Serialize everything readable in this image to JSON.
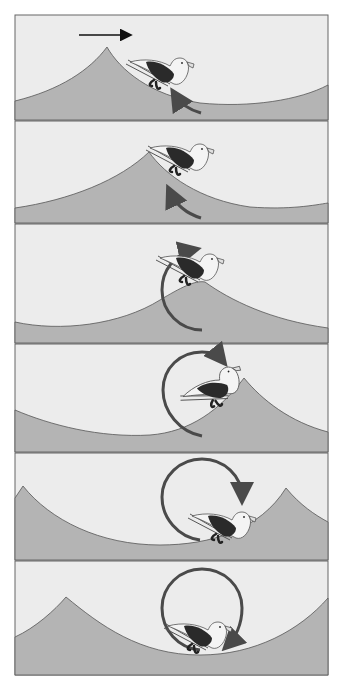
{
  "figure": {
    "type": "multi-panel sequence diagram",
    "panel_count": 6,
    "colors": {
      "sky": "#ececec",
      "water": "#b4b4b4",
      "outline": "#555555",
      "orbit_arrow": "#4a4a4a",
      "bird_wing": "#2a2a2a",
      "bird_body": "#f4f4f4"
    },
    "direction_arrow": "wave travels right (arrow in panel 1)",
    "panels": [
      {
        "index": 1,
        "description": "bird on back slope of wave just behind crest; short curved arrow below bird",
        "orbit": "short arc"
      },
      {
        "index": 2,
        "description": "bird slides down forward face as crest passes; curved arrow below",
        "orbit": "short arc"
      },
      {
        "index": 3,
        "description": "bird at crest; arc arrow sweeps up over bird",
        "orbit": "half circle"
      },
      {
        "index": 4,
        "description": "bird on back of crest; arrow three-quarter circle",
        "orbit": "three-quarter circle"
      },
      {
        "index": 5,
        "description": "bird in trough; nearly full circle arrow",
        "orbit": "near-full circle"
      },
      {
        "index": 6,
        "description": "bird at bottom of trough; full circular orbit arrow",
        "orbit": "full circle"
      }
    ]
  }
}
